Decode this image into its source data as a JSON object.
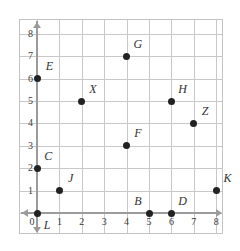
{
  "chart_data": {
    "type": "scatter",
    "title": "",
    "xlabel": "",
    "ylabel": "",
    "xlim": [
      0,
      8
    ],
    "ylim": [
      0,
      8
    ],
    "grid": true,
    "legend": "none",
    "x_ticks": [
      "0",
      "1",
      "2",
      "3",
      "4",
      "5",
      "6",
      "7",
      "8"
    ],
    "y_ticks": [
      "0",
      "1",
      "2",
      "3",
      "4",
      "5",
      "6",
      "7",
      "8"
    ],
    "points": [
      {
        "label": "L",
        "x": 0,
        "y": 0,
        "label_dx": 0.45,
        "label_dy": 0.55
      },
      {
        "label": "C",
        "x": 0,
        "y": 2,
        "label_dx": 0.5,
        "label_dy": -0.55
      },
      {
        "label": "E",
        "x": 0,
        "y": 6,
        "label_dx": 0.55,
        "label_dy": -0.55
      },
      {
        "label": "J",
        "x": 1,
        "y": 1,
        "label_dx": 0.5,
        "label_dy": -0.55
      },
      {
        "label": "X",
        "x": 2,
        "y": 5,
        "label_dx": 0.5,
        "label_dy": -0.55
      },
      {
        "label": "G",
        "x": 4,
        "y": 7,
        "label_dx": 0.5,
        "label_dy": -0.55
      },
      {
        "label": "F",
        "x": 4,
        "y": 3,
        "label_dx": 0.5,
        "label_dy": -0.55
      },
      {
        "label": "B",
        "x": 5,
        "y": 0,
        "label_dx": -0.5,
        "label_dy": -0.55
      },
      {
        "label": "D",
        "x": 6,
        "y": 0,
        "label_dx": 0.5,
        "label_dy": -0.55
      },
      {
        "label": "H",
        "x": 6,
        "y": 5,
        "label_dx": 0.5,
        "label_dy": -0.55
      },
      {
        "label": "Z",
        "x": 7,
        "y": 4,
        "label_dx": 0.5,
        "label_dy": -0.55
      },
      {
        "label": "K",
        "x": 8,
        "y": 1,
        "label_dx": 0.5,
        "label_dy": -0.55
      }
    ],
    "colors": {
      "point": "#222222",
      "gridline": "#c8c8c8",
      "axis": "#9b9b9b",
      "tick_text": "#3a3a3a",
      "label_text": "#333333",
      "background": "#ffffff",
      "border": "#c3c3c3"
    }
  }
}
